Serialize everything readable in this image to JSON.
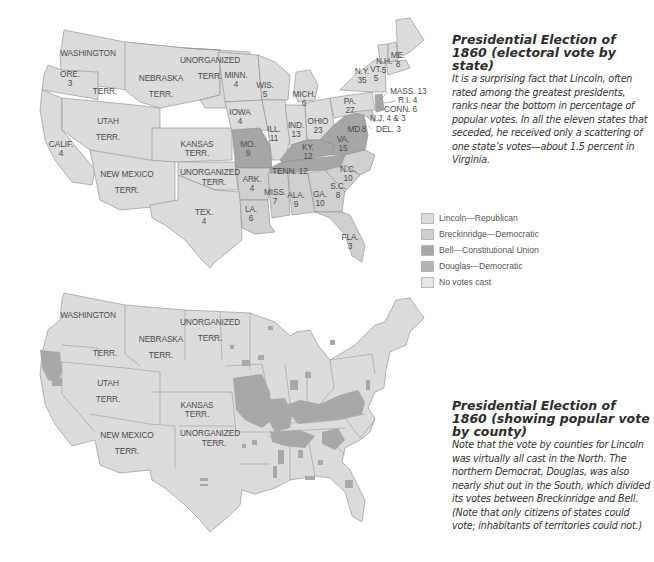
{
  "legend": {
    "items": [
      {
        "label": "Lincoln—Republican",
        "color": "#dcdcdc"
      },
      {
        "label": "Breckinridge—Democratic",
        "color": "#d4d4d4"
      },
      {
        "label": "Bell—Constitutional Union",
        "color": "#a6a6a6"
      },
      {
        "label": "Douglas—Democratic",
        "color": "#b4b4b4"
      },
      {
        "label": "No votes cast",
        "color": "#e6e6e6"
      }
    ]
  },
  "captions": {
    "top": {
      "title": "Presidential Election of 1860 (electoral vote by state)",
      "body": "It is a surprising fact that Lincoln, often rated among the greatest presidents, ranks near the bottom in percentage of popular votes. In all the eleven states that seceded, he received only a scattering of one state’s votes—about 1.5 percent in Virginia."
    },
    "bottom": {
      "title": "Presidential Election of 1860 (showing popular vote by county)",
      "body": "Note that the vote by counties for Lincoln was virtually all cast in the North. The northern Democrat, Douglas, was also nearly shut out in the South, which divided its votes between Breckinridge and Bell. (Note that only citizens of states could vote; inhabitants of territories could not.)"
    }
  },
  "map_top": {
    "territories": {
      "washington": [
        "WASHINGTON",
        "TERR."
      ],
      "nebraska": [
        "NEBRASKA",
        "TERR."
      ],
      "unorganized_north": [
        "UNORGANIZED",
        "TERR."
      ],
      "utah": [
        "UTAH",
        "TERR."
      ],
      "new_mexico": [
        "NEW MEXICO",
        "TERR."
      ],
      "kansas": [
        "KANSAS",
        "TERR."
      ],
      "unorganized_south": [
        "UNORGANIZED",
        "TERR."
      ]
    },
    "states": [
      {
        "name": "ORE.",
        "votes": "3"
      },
      {
        "name": "CALIF.",
        "votes": "4"
      },
      {
        "name": "MINN.",
        "votes": "4"
      },
      {
        "name": "IOWA",
        "votes": "4"
      },
      {
        "name": "WIS.",
        "votes": "5"
      },
      {
        "name": "MICH.",
        "votes": "6"
      },
      {
        "name": "ILL.",
        "votes": "11"
      },
      {
        "name": "IND.",
        "votes": "13"
      },
      {
        "name": "OHIO",
        "votes": "23"
      },
      {
        "name": "PA.",
        "votes": "27"
      },
      {
        "name": "N.Y.",
        "votes": "35"
      },
      {
        "name": "VT.",
        "votes": "5"
      },
      {
        "name": "N.H.",
        "votes": "5"
      },
      {
        "name": "ME.",
        "votes": "8"
      },
      {
        "name": "MO.",
        "votes": "9"
      },
      {
        "name": "KY.",
        "votes": "12"
      },
      {
        "name": "VA.",
        "votes": "15"
      },
      {
        "name": "MD.",
        "votes": "8"
      },
      {
        "name": "TENN.",
        "votes": "12"
      },
      {
        "name": "N.C.",
        "votes": "10"
      },
      {
        "name": "S.C.",
        "votes": "8"
      },
      {
        "name": "GA.",
        "votes": "10"
      },
      {
        "name": "ALA.",
        "votes": "9"
      },
      {
        "name": "MISS.",
        "votes": "7"
      },
      {
        "name": "LA.",
        "votes": "6"
      },
      {
        "name": "ARK.",
        "votes": "4"
      },
      {
        "name": "TEX.",
        "votes": "4"
      },
      {
        "name": "FLA.",
        "votes": "3"
      }
    ],
    "callouts": [
      "MASS. 13",
      "R.I. 4",
      "CONN. 6",
      "N.J. 4 & 3",
      "DEL. 3"
    ]
  },
  "map_bottom": {
    "territories": {
      "washington": [
        "WASHINGTON",
        "TERR."
      ],
      "nebraska": [
        "NEBRASKA",
        "TERR."
      ],
      "unorganized_north": [
        "UNORGANIZED",
        "TERR."
      ],
      "utah": [
        "UTAH",
        "TERR."
      ],
      "new_mexico": [
        "NEW MEXICO",
        "TERR."
      ],
      "kansas": [
        "KANSAS",
        "TERR."
      ],
      "unorganized_south": [
        "UNORGANIZED",
        "TERR."
      ]
    }
  }
}
